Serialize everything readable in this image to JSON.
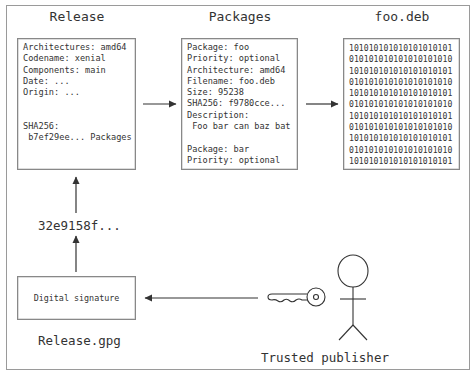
{
  "release": {
    "title": "Release",
    "lines": "Architectures: amd64\nCodename: xenial\nComponents: main\nDate: ...\nOrigin: ...\n\n\nSHA256:\n b7ef29ee... Packages"
  },
  "packages": {
    "title": "Packages",
    "lines": "Package: foo\nPriority: optional\nArchitecture: amd64\nFilename: foo.deb\nSize: 95238\nSHA256: f9780cce...\nDescription:\n Foo bar can baz bat\n\nPackage: bar\nPriority: optional"
  },
  "deb": {
    "title": "foo.deb",
    "lines": "101010101010101010101\n010101010101010101010\n101010101010101010101\n010101010101010101010\n101010101010101010101\n010101010101010101010\n101010101010101010101\n010101010101010101010\n101010101010101010101\n010101010101010101010\n101010101010101010101"
  },
  "hash": {
    "label": "32e9158f..."
  },
  "signature": {
    "box_label": "Digital signature",
    "file_label": "Release.gpg"
  },
  "publisher": {
    "label": "Trusted publisher"
  },
  "colors": {
    "stroke": "#333333",
    "frame": "#9a9a9a",
    "box_border": "#888888"
  }
}
